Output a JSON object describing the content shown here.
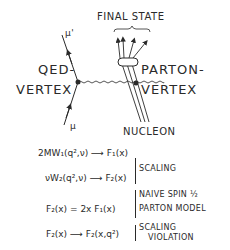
{
  "diagram": {
    "labels": {
      "final_state": "FINAL STATE",
      "mu_out": "μ'",
      "mu_in": "μ",
      "qed_line1": "QED-",
      "qed_line2": "VERTEX",
      "parton_line1": "PARTON-",
      "parton_line2": "VERTEX",
      "nucleon": "NUCLEON"
    },
    "equations": [
      {
        "lhs": "2MW₁(q²,ν) ⟶ F₁(x)",
        "note": ""
      },
      {
        "lhs": "νW₂(q²,ν) ⟶ F₂(x)",
        "note": "SCALING"
      },
      {
        "lhs": "F₂(x) = 2x F₁(x)",
        "note_line1": "NAIVE SPIN ½",
        "note_line2": "PARTON MODEL"
      },
      {
        "lhs": "F₂(x) ⟶ F₂(x,q²)",
        "note_line1": "SCALING",
        "note_line2": "VIOLATION"
      }
    ]
  }
}
